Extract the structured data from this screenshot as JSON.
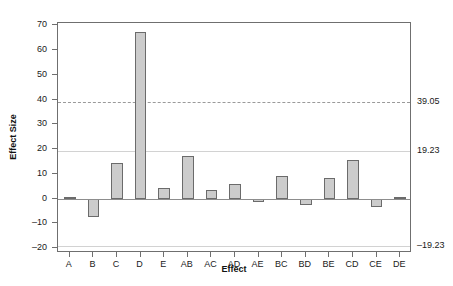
{
  "chart_data": {
    "type": "bar",
    "title": "",
    "subtitle": "",
    "xlabel": "Effect",
    "ylabel": "Effect Size",
    "categories": [
      "A",
      "B",
      "C",
      "D",
      "E",
      "AB",
      "AC",
      "AD",
      "AE",
      "BC",
      "BD",
      "BE",
      "CD",
      "CE",
      "DE"
    ],
    "values": [
      0.6,
      -7.4,
      14.3,
      67.4,
      4.1,
      17.2,
      3.3,
      5.8,
      -1.5,
      9.0,
      -2.5,
      8.5,
      15.6,
      -3.4,
      0.7
    ],
    "ylim": [
      -22,
      71
    ],
    "yticks": [
      70,
      60,
      50,
      40,
      30,
      20,
      10,
      0,
      -10,
      -20
    ],
    "ytick_labels": [
      "70",
      "60",
      "50",
      "40",
      "30",
      "20",
      "10",
      "0",
      "–10",
      "–20"
    ],
    "grid": false,
    "legend": "none",
    "reference_lines": [
      {
        "value": 39.05,
        "label": "39.05",
        "style": "dashed",
        "color": "#9a9a9a"
      },
      {
        "value": 19.23,
        "label": "19.23",
        "style": "solid",
        "color": "#d2d2d2"
      },
      {
        "value": -19.23,
        "label": "–19.23",
        "style": "solid",
        "color": "#d2d2d2"
      }
    ],
    "bar_fill_color": "#cccccc",
    "bar_border_color": "#6b6b6b",
    "zero_line_color": "#8d8d8d",
    "frame_color": "#6f6f6f"
  }
}
